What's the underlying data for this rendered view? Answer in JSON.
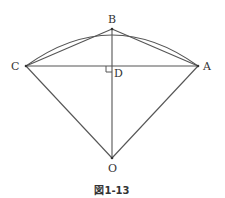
{
  "figure": {
    "caption": "図1-13",
    "points": {
      "A": {
        "label": "A",
        "x": 198,
        "y": 66
      },
      "B": {
        "label": "B",
        "x": 112,
        "y": 29
      },
      "C": {
        "label": "C",
        "x": 26,
        "y": 66
      },
      "D": {
        "label": "D",
        "x": 112,
        "y": 66
      },
      "O": {
        "label": "O",
        "x": 112,
        "y": 158
      }
    },
    "segments": [
      "CA",
      "CB",
      "BA",
      "BO",
      "CO",
      "AO"
    ],
    "arc": "CBA centered at O",
    "right_angle_at": "D",
    "colors": {
      "line": "#555555",
      "text": "#333333"
    }
  }
}
